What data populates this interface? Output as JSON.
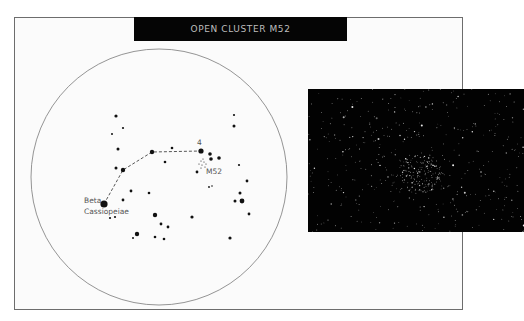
{
  "title": "OPEN CLUSTER M52",
  "colors": {
    "frame_border": "#6d6d6d",
    "title_bg": "#050505",
    "title_text": "#bdbdbd",
    "star": "#111111",
    "photo_bg": "#020202"
  },
  "finder_chart": {
    "circle": {
      "cx": 159,
      "cy": 177,
      "r": 128
    },
    "labels": [
      {
        "id": "beta-1",
        "text": "Beta",
        "x": 84,
        "y": 203
      },
      {
        "id": "beta-2",
        "text": "Cassiopeiae",
        "x": 84,
        "y": 214
      },
      {
        "id": "star4",
        "text": "4",
        "x": 197,
        "y": 145
      },
      {
        "id": "m52",
        "text": "M52",
        "x": 206,
        "y": 174
      }
    ],
    "path": [
      [
        104,
        204
      ],
      [
        123,
        170
      ],
      [
        152,
        152
      ],
      [
        201,
        151
      ]
    ],
    "stars": [
      [
        104,
        204,
        3.6
      ],
      [
        123,
        170,
        2.2
      ],
      [
        152,
        152,
        2.2
      ],
      [
        201,
        151,
        2.6
      ],
      [
        116,
        116,
        1.6
      ],
      [
        123,
        128,
        1.1
      ],
      [
        112,
        134,
        1.0
      ],
      [
        118,
        149,
        1.5
      ],
      [
        116,
        168,
        1.5
      ],
      [
        165,
        162,
        1.3
      ],
      [
        172,
        148,
        1.3
      ],
      [
        210,
        154,
        1.8
      ],
      [
        211,
        159,
        1.8
      ],
      [
        219,
        158,
        1.8
      ],
      [
        197,
        172,
        1.4
      ],
      [
        234,
        115,
        1.1
      ],
      [
        234,
        126,
        1.5
      ],
      [
        239,
        165,
        1.1
      ],
      [
        247,
        181,
        1.4
      ],
      [
        240,
        193,
        1.5
      ],
      [
        242,
        201,
        2.4
      ],
      [
        235,
        201,
        1.5
      ],
      [
        249,
        214,
        1.4
      ],
      [
        230,
        238,
        1.6
      ],
      [
        131,
        191,
        1.4
      ],
      [
        123,
        200,
        1.4
      ],
      [
        149,
        193,
        1.3
      ],
      [
        110,
        218,
        1.1
      ],
      [
        115,
        217,
        1.1
      ],
      [
        155,
        215,
        2.2
      ],
      [
        161,
        224,
        1.4
      ],
      [
        168,
        227,
        1.4
      ],
      [
        192,
        217,
        1.6
      ],
      [
        137,
        234,
        2.2
      ],
      [
        133,
        238,
        1.0
      ],
      [
        155,
        237,
        1.3
      ],
      [
        164,
        239,
        1.3
      ],
      [
        209,
        187,
        0.9
      ],
      [
        212,
        186,
        0.8
      ]
    ],
    "cluster_dots": [
      [
        201,
        161
      ],
      [
        204,
        162
      ],
      [
        206,
        164
      ],
      [
        202,
        165
      ],
      [
        199,
        164
      ],
      [
        205,
        167
      ],
      [
        201,
        168
      ],
      [
        203,
        159
      ]
    ]
  },
  "photo": {
    "seed": 52,
    "field_stars": 420,
    "cluster_stars": 160,
    "cluster_cx": 113,
    "cluster_cy": 84,
    "cluster_r": 22
  }
}
